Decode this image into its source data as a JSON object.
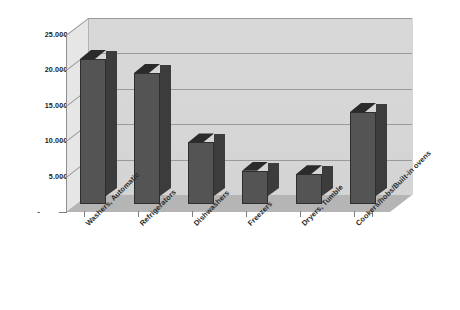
{
  "chart_data": {
    "type": "bar",
    "title": "",
    "subtitle": "",
    "xlabel": "",
    "ylabel": "",
    "categories": [
      "Washers, Automatic",
      "Refrigerators",
      "Dishwashers",
      "Freezers",
      "Dryers, Tumble",
      "Cookers/hobs/Built-in ovens"
    ],
    "values": [
      20500,
      18500,
      8700,
      4700,
      4200,
      13000
    ],
    "series": [
      {
        "name": "Series 1",
        "values": [
          20500,
          18500,
          8700,
          4700,
          4200,
          13000
        ]
      }
    ],
    "ylim": [
      0,
      25000
    ],
    "ytick_values": [
      0,
      5000,
      10000,
      15000,
      20000,
      25000
    ],
    "ytick_labels": [
      "-",
      "5.000,00",
      "10.000,00",
      "15.000,00",
      "20.000,00",
      "25.000,00"
    ],
    "grid": true,
    "legend": false,
    "legend_position": "none",
    "three_d": true,
    "number_format": "european",
    "annotations": []
  },
  "style": {
    "bar_face_color": "#545454",
    "bar_side_color": "#3c3c3c",
    "bar_top_color": "#2b2b2b",
    "plot_background_color": "#d6d6d6",
    "floor_color": "#aeaeae",
    "sidewall_color": "#e6e6e6",
    "gridline_color": "#9a9a9a",
    "axis_color": "#8f8f8f",
    "text_color": "#222222",
    "page_background_color": "#ffffff"
  }
}
